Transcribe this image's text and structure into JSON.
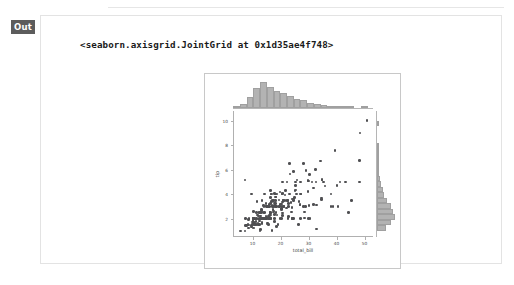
{
  "cell": {
    "out_label": "Out",
    "repr_text": "<seaborn.axisgrid.JointGrid at 0x1d35ae4f748>"
  },
  "colors": {
    "out_badge_bg": "#5c5c5c",
    "card_border": "#e3e3e3",
    "figure_border": "#c8c8c8",
    "point": "#4f4f52",
    "hist_fill": "#b3b3b3",
    "hist_edge": "#a0a0a0",
    "spine": "#b0b0b0",
    "tick_text": "#4a4a4a"
  },
  "chart_data": {
    "type": "scatter",
    "title": "",
    "xlabel": "total_bill",
    "ylabel": "tip",
    "xlim": [
      3.0,
      53.0
    ],
    "ylim": [
      0.5,
      10.8
    ],
    "xticks": [
      10,
      20,
      30,
      40,
      50
    ],
    "yticks": [
      2,
      4,
      6,
      8,
      10
    ],
    "grid": false,
    "legend": false,
    "marginal_x": {
      "type": "bar",
      "orientation": "vertical",
      "bin_edges": [
        3.07,
        5.47,
        7.87,
        10.27,
        12.67,
        15.07,
        17.47,
        19.87,
        22.27,
        24.67,
        27.07,
        29.47,
        31.87,
        34.27,
        36.67,
        39.07,
        41.47,
        43.87,
        46.27,
        48.67,
        51.07
      ],
      "counts": [
        2,
        6,
        17,
        30,
        39,
        32,
        25,
        23,
        18,
        14,
        12,
        8,
        6,
        4,
        3,
        2,
        1,
        1,
        0,
        1
      ]
    },
    "marginal_y": {
      "type": "bar",
      "orientation": "horizontal",
      "bin_edges": [
        1.0,
        1.45,
        1.9,
        2.35,
        2.8,
        3.25,
        3.7,
        4.15,
        4.6,
        5.05,
        5.5,
        5.95,
        6.4,
        6.85,
        7.3,
        7.75,
        8.2,
        8.65,
        9.1,
        9.55,
        10.0
      ],
      "counts": [
        20,
        33,
        41,
        36,
        31,
        22,
        17,
        14,
        9,
        6,
        5,
        3,
        2,
        2,
        1,
        1,
        0,
        0,
        0,
        1
      ]
    },
    "points": [
      [
        16.99,
        1.01
      ],
      [
        10.34,
        1.66
      ],
      [
        21.01,
        3.5
      ],
      [
        23.68,
        3.31
      ],
      [
        24.59,
        3.61
      ],
      [
        25.29,
        4.71
      ],
      [
        8.77,
        2.0
      ],
      [
        26.88,
        3.12
      ],
      [
        15.04,
        1.96
      ],
      [
        14.78,
        3.23
      ],
      [
        10.27,
        1.71
      ],
      [
        35.26,
        5.0
      ],
      [
        15.42,
        1.57
      ],
      [
        18.43,
        3.0
      ],
      [
        14.83,
        3.02
      ],
      [
        21.58,
        3.92
      ],
      [
        10.33,
        1.67
      ],
      [
        16.29,
        3.71
      ],
      [
        16.97,
        3.5
      ],
      [
        20.65,
        3.35
      ],
      [
        17.92,
        4.08
      ],
      [
        20.29,
        2.75
      ],
      [
        15.77,
        2.23
      ],
      [
        39.42,
        7.58
      ],
      [
        19.82,
        3.18
      ],
      [
        17.81,
        2.34
      ],
      [
        13.37,
        2.0
      ],
      [
        12.69,
        2.0
      ],
      [
        21.7,
        4.3
      ],
      [
        19.65,
        3.0
      ],
      [
        9.55,
        1.45
      ],
      [
        18.35,
        2.5
      ],
      [
        15.06,
        3.0
      ],
      [
        20.69,
        2.45
      ],
      [
        17.78,
        3.27
      ],
      [
        24.06,
        3.6
      ],
      [
        16.31,
        2.0
      ],
      [
        16.93,
        3.07
      ],
      [
        18.69,
        2.31
      ],
      [
        31.27,
        5.0
      ],
      [
        16.04,
        2.24
      ],
      [
        17.46,
        2.54
      ],
      [
        13.94,
        3.06
      ],
      [
        9.68,
        1.32
      ],
      [
        30.4,
        5.6
      ],
      [
        18.29,
        3.0
      ],
      [
        22.23,
        5.0
      ],
      [
        32.4,
        6.0
      ],
      [
        28.55,
        2.05
      ],
      [
        18.04,
        3.0
      ],
      [
        12.54,
        2.5
      ],
      [
        10.29,
        2.6
      ],
      [
        34.81,
        5.2
      ],
      [
        9.94,
        1.56
      ],
      [
        25.56,
        4.34
      ],
      [
        19.49,
        3.51
      ],
      [
        38.01,
        3.0
      ],
      [
        26.41,
        1.5
      ],
      [
        11.24,
        1.76
      ],
      [
        48.27,
        6.73
      ],
      [
        20.29,
        3.21
      ],
      [
        13.81,
        2.0
      ],
      [
        11.02,
        1.98
      ],
      [
        18.29,
        3.76
      ],
      [
        17.59,
        2.64
      ],
      [
        20.08,
        3.15
      ],
      [
        16.45,
        2.47
      ],
      [
        3.07,
        1.0
      ],
      [
        20.23,
        2.01
      ],
      [
        15.01,
        2.09
      ],
      [
        12.02,
        1.97
      ],
      [
        17.07,
        3.0
      ],
      [
        26.86,
        3.14
      ],
      [
        25.28,
        5.0
      ],
      [
        14.73,
        2.2
      ],
      [
        10.51,
        1.25
      ],
      [
        17.92,
        3.08
      ],
      [
        27.2,
        4.0
      ],
      [
        22.76,
        3.0
      ],
      [
        17.29,
        2.71
      ],
      [
        19.44,
        3.0
      ],
      [
        16.66,
        3.4
      ],
      [
        10.07,
        1.83
      ],
      [
        32.68,
        5.0
      ],
      [
        15.98,
        2.03
      ],
      [
        34.83,
        5.17
      ],
      [
        13.03,
        2.0
      ],
      [
        18.28,
        4.0
      ],
      [
        24.71,
        5.85
      ],
      [
        21.16,
        3.0
      ],
      [
        28.97,
        3.0
      ],
      [
        22.49,
        3.5
      ],
      [
        5.75,
        1.0
      ],
      [
        16.32,
        4.3
      ],
      [
        22.75,
        3.25
      ],
      [
        40.17,
        4.73
      ],
      [
        27.28,
        4.0
      ],
      [
        12.03,
        1.5
      ],
      [
        21.01,
        3.0
      ],
      [
        12.46,
        1.5
      ],
      [
        11.35,
        2.5
      ],
      [
        15.38,
        3.0
      ],
      [
        44.3,
        2.5
      ],
      [
        22.42,
        3.48
      ],
      [
        20.92,
        4.08
      ],
      [
        15.36,
        1.64
      ],
      [
        20.49,
        4.06
      ],
      [
        25.21,
        4.29
      ],
      [
        18.24,
        3.76
      ],
      [
        14.31,
        4.0
      ],
      [
        14.0,
        3.0
      ],
      [
        7.25,
        1.0
      ],
      [
        38.07,
        4.0
      ],
      [
        23.95,
        2.55
      ],
      [
        25.71,
        4.0
      ],
      [
        17.31,
        3.5
      ],
      [
        29.93,
        5.07
      ],
      [
        10.65,
        1.5
      ],
      [
        12.43,
        1.8
      ],
      [
        24.08,
        2.92
      ],
      [
        11.69,
        2.31
      ],
      [
        13.42,
        1.68
      ],
      [
        14.26,
        2.5
      ],
      [
        15.95,
        2.0
      ],
      [
        12.48,
        2.52
      ],
      [
        29.8,
        4.2
      ],
      [
        8.52,
        1.48
      ],
      [
        14.52,
        2.0
      ],
      [
        11.38,
        2.0
      ],
      [
        22.82,
        2.18
      ],
      [
        19.08,
        1.5
      ],
      [
        20.27,
        2.83
      ],
      [
        11.17,
        1.5
      ],
      [
        12.26,
        2.0
      ],
      [
        18.26,
        3.25
      ],
      [
        8.51,
        1.25
      ],
      [
        10.33,
        2.0
      ],
      [
        14.15,
        2.0
      ],
      [
        16.0,
        2.0
      ],
      [
        13.16,
        2.75
      ],
      [
        17.47,
        3.5
      ],
      [
        34.3,
        6.7
      ],
      [
        41.19,
        5.0
      ],
      [
        27.05,
        5.0
      ],
      [
        16.43,
        2.3
      ],
      [
        8.35,
        1.5
      ],
      [
        18.64,
        1.36
      ],
      [
        11.87,
        1.63
      ],
      [
        9.78,
        1.73
      ],
      [
        7.51,
        2.0
      ],
      [
        14.07,
        2.5
      ],
      [
        13.13,
        2.0
      ],
      [
        17.26,
        2.74
      ],
      [
        24.55,
        2.0
      ],
      [
        19.77,
        2.0
      ],
      [
        29.85,
        5.14
      ],
      [
        48.17,
        5.0
      ],
      [
        25.0,
        3.75
      ],
      [
        13.39,
        2.61
      ],
      [
        16.49,
        2.0
      ],
      [
        21.5,
        3.5
      ],
      [
        12.66,
        2.5
      ],
      [
        16.21,
        2.0
      ],
      [
        13.81,
        2.0
      ],
      [
        17.51,
        3.0
      ],
      [
        24.52,
        3.48
      ],
      [
        20.76,
        2.24
      ],
      [
        31.71,
        4.5
      ],
      [
        10.59,
        1.61
      ],
      [
        10.63,
        2.0
      ],
      [
        50.81,
        10.0
      ],
      [
        15.81,
        3.16
      ],
      [
        7.25,
        5.15
      ],
      [
        31.85,
        3.18
      ],
      [
        16.82,
        4.0
      ],
      [
        32.9,
        3.11
      ],
      [
        17.89,
        2.0
      ],
      [
        14.48,
        2.0
      ],
      [
        9.6,
        4.0
      ],
      [
        34.63,
        3.55
      ],
      [
        34.65,
        3.68
      ],
      [
        23.33,
        5.65
      ],
      [
        45.35,
        3.5
      ],
      [
        23.17,
        6.5
      ],
      [
        40.55,
        3.0
      ],
      [
        20.69,
        5.0
      ],
      [
        20.9,
        3.5
      ],
      [
        30.46,
        2.0
      ],
      [
        18.15,
        3.5
      ],
      [
        23.1,
        4.0
      ],
      [
        15.69,
        1.5
      ],
      [
        19.81,
        4.19
      ],
      [
        28.44,
        2.56
      ],
      [
        15.48,
        2.02
      ],
      [
        16.58,
        4.0
      ],
      [
        7.56,
        1.44
      ],
      [
        10.34,
        2.0
      ],
      [
        43.11,
        5.0
      ],
      [
        13.0,
        2.0
      ],
      [
        13.51,
        2.0
      ],
      [
        18.71,
        4.0
      ],
      [
        12.74,
        2.01
      ],
      [
        13.0,
        2.0
      ],
      [
        16.4,
        2.5
      ],
      [
        20.53,
        4.0
      ],
      [
        16.47,
        3.23
      ],
      [
        26.59,
        3.41
      ],
      [
        38.73,
        3.0
      ],
      [
        24.27,
        2.03
      ],
      [
        12.76,
        2.23
      ],
      [
        30.06,
        2.0
      ],
      [
        25.89,
        5.16
      ],
      [
        48.33,
        9.0
      ],
      [
        13.27,
        2.5
      ],
      [
        28.17,
        6.5
      ],
      [
        12.9,
        1.1
      ],
      [
        28.15,
        3.0
      ],
      [
        11.59,
        1.5
      ],
      [
        7.74,
        1.44
      ],
      [
        30.14,
        3.09
      ],
      [
        12.16,
        2.2
      ],
      [
        13.42,
        3.48
      ],
      [
        8.58,
        1.92
      ],
      [
        15.98,
        3.0
      ],
      [
        13.42,
        1.58
      ],
      [
        16.27,
        2.5
      ],
      [
        10.09,
        2.0
      ],
      [
        20.45,
        3.0
      ],
      [
        13.28,
        2.72
      ],
      [
        22.12,
        2.88
      ],
      [
        24.01,
        2.0
      ],
      [
        15.69,
        3.0
      ],
      [
        11.61,
        3.39
      ],
      [
        10.77,
        1.47
      ],
      [
        15.53,
        3.0
      ],
      [
        10.07,
        1.25
      ],
      [
        12.6,
        1.0
      ],
      [
        32.83,
        1.17
      ],
      [
        35.83,
        4.67
      ],
      [
        29.03,
        5.92
      ],
      [
        27.18,
        2.0
      ],
      [
        22.67,
        2.0
      ],
      [
        17.82,
        1.75
      ],
      [
        18.78,
        3.0
      ]
    ]
  }
}
